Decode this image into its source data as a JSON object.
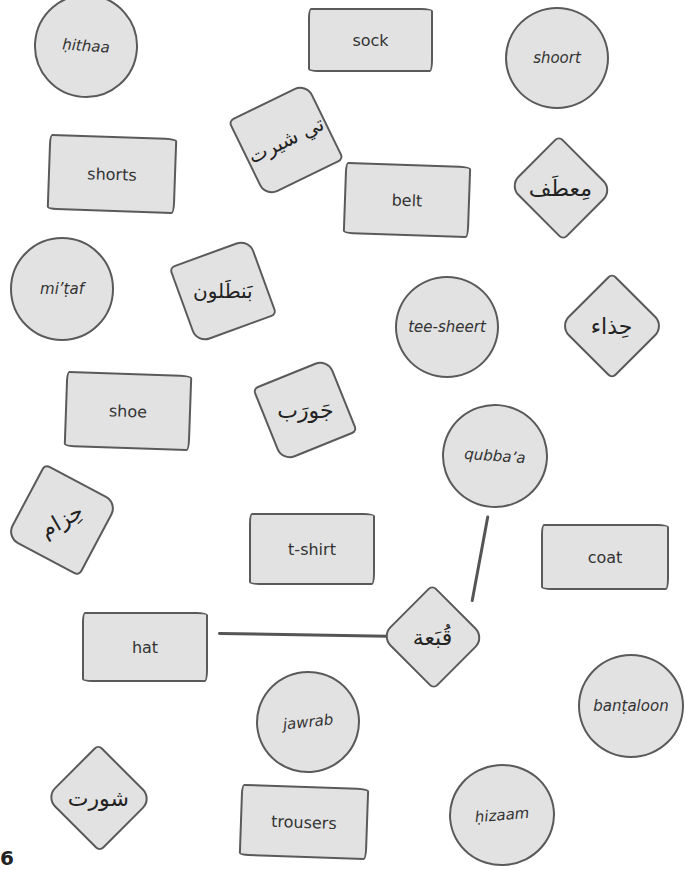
{
  "page_number": "6",
  "colors": {
    "card_fill": "#e2e2e2",
    "outline": "#5a5a5a",
    "background": "#ffffff"
  },
  "transliteration_cards": [
    {
      "id": "hithaa",
      "text": "ḥithaa"
    },
    {
      "id": "shoort",
      "text": "shoort"
    },
    {
      "id": "mitaf",
      "text": "mi’ṭaf"
    },
    {
      "id": "tee-sheert",
      "text": "tee-sheert"
    },
    {
      "id": "qubbaa",
      "text": "qubba’a"
    },
    {
      "id": "bantaloon",
      "text": "banṭaloon"
    },
    {
      "id": "jawrab",
      "text": "jawrab"
    },
    {
      "id": "hizaam",
      "text": "ḥizaam"
    }
  ],
  "english_cards": [
    {
      "id": "sock",
      "text": "sock"
    },
    {
      "id": "shorts",
      "text": "shorts"
    },
    {
      "id": "belt",
      "text": "belt"
    },
    {
      "id": "shoe",
      "text": "shoe"
    },
    {
      "id": "t-shirt",
      "text": "t-shirt"
    },
    {
      "id": "coat",
      "text": "coat"
    },
    {
      "id": "hat",
      "text": "hat"
    },
    {
      "id": "trousers",
      "text": "trousers"
    }
  ],
  "arabic_cards": [
    {
      "id": "ar-tshirt",
      "text": "تي شيرت"
    },
    {
      "id": "ar-coat",
      "text": "مِعطَف"
    },
    {
      "id": "ar-trousers",
      "text": "بَنطَلون"
    },
    {
      "id": "ar-shoe",
      "text": "حِذاء"
    },
    {
      "id": "ar-sock",
      "text": "جَورَب"
    },
    {
      "id": "ar-belt",
      "text": "حِزام"
    },
    {
      "id": "ar-hat",
      "text": "قُبَعة"
    },
    {
      "id": "ar-shorts",
      "text": "شورت"
    }
  ],
  "connections": [
    {
      "from": "hat",
      "to": "ar-hat"
    },
    {
      "from": "qubbaa",
      "to": "ar-hat"
    }
  ]
}
